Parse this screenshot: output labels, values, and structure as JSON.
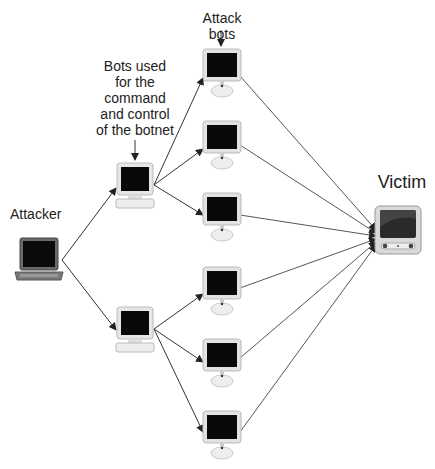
{
  "diagram": {
    "type": "botnet-ddos",
    "labels": {
      "attack_bots": "Attack bots",
      "cc_line1": "Bots used",
      "cc_line2": "for  the",
      "cc_line3": "command",
      "cc_line4": "and control",
      "cc_line5": "of the botnet",
      "attacker": "Attacker",
      "victim": "Victim"
    },
    "nodes": [
      {
        "id": "attacker",
        "kind": "laptop",
        "label": "Attacker"
      },
      {
        "id": "cc1",
        "kind": "desktop",
        "group": "command-and-control"
      },
      {
        "id": "cc2",
        "kind": "desktop",
        "group": "command-and-control"
      },
      {
        "id": "bot1",
        "kind": "imac",
        "group": "attack-bots"
      },
      {
        "id": "bot2",
        "kind": "imac",
        "group": "attack-bots"
      },
      {
        "id": "bot3",
        "kind": "imac",
        "group": "attack-bots"
      },
      {
        "id": "bot4",
        "kind": "imac",
        "group": "attack-bots"
      },
      {
        "id": "bot5",
        "kind": "imac",
        "group": "attack-bots"
      },
      {
        "id": "bot6",
        "kind": "imac",
        "group": "attack-bots"
      },
      {
        "id": "victim",
        "kind": "server",
        "label": "Victim"
      }
    ],
    "edges": [
      [
        "attacker",
        "cc1"
      ],
      [
        "attacker",
        "cc2"
      ],
      [
        "cc1",
        "bot1"
      ],
      [
        "cc1",
        "bot2"
      ],
      [
        "cc1",
        "bot3"
      ],
      [
        "cc2",
        "bot4"
      ],
      [
        "cc2",
        "bot5"
      ],
      [
        "cc2",
        "bot6"
      ],
      [
        "bot1",
        "victim"
      ],
      [
        "bot2",
        "victim"
      ],
      [
        "bot3",
        "victim"
      ],
      [
        "bot4",
        "victim"
      ],
      [
        "bot5",
        "victim"
      ],
      [
        "bot6",
        "victim"
      ]
    ]
  }
}
